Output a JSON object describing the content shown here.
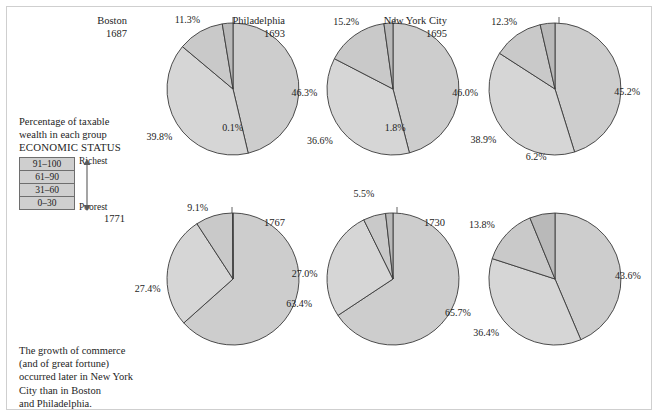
{
  "figure": {
    "caption_top": "Percentage of taxable\nwealth in each group",
    "economic_status_label": "ECONOMIC STATUS",
    "caption_bottom": "The growth of commerce\n(and of great fortune)\noccurred later in New York\nCity than in Boston\nand Philadelphia."
  },
  "legend": {
    "richest_label": "Richest",
    "poorest_label": "Poorest",
    "bands": [
      {
        "label": "91–100",
        "color": "#cfcfcf"
      },
      {
        "label": "61–90",
        "color": "#cfcfcf"
      },
      {
        "label": "31–60",
        "color": "#cfcfcf"
      },
      {
        "label": "0–30",
        "color": "#cfcfcf"
      }
    ]
  },
  "chart_data": {
    "type": "pie",
    "title": "Percentage of taxable wealth in each group",
    "categories": [
      "91–100",
      "61–90",
      "31–60",
      "0–30"
    ],
    "legend_position": "left",
    "charts": [
      {
        "city": "Boston",
        "year": "1687",
        "values": [
          46.3,
          39.8,
          11.3,
          2.6
        ],
        "labels": [
          "46.3%",
          "39.8%",
          "11.3%",
          "2.6%"
        ]
      },
      {
        "city": "Philadelphia",
        "year": "1693",
        "values": [
          46.0,
          36.6,
          15.2,
          2.2
        ],
        "labels": [
          "46.0%",
          "36.6%",
          "15.2%",
          "2.2%"
        ]
      },
      {
        "city": "New York City",
        "year": "1695",
        "values": [
          45.2,
          38.9,
          12.3,
          3.6
        ],
        "labels": [
          "45.2%",
          "38.9%",
          "12.3%",
          "3.6%"
        ]
      },
      {
        "city": "",
        "year": "1771",
        "values": [
          63.4,
          27.4,
          9.1,
          0.1
        ],
        "labels": [
          "63.4%",
          "27.4%",
          "9.1%",
          "0.1%"
        ]
      },
      {
        "city": "",
        "year": "1767",
        "values": [
          65.7,
          27.0,
          5.5,
          1.8
        ],
        "labels": [
          "65.7%",
          "27.0%",
          "5.5%",
          "1.8%"
        ]
      },
      {
        "city": "",
        "year": "1730",
        "values": [
          43.6,
          36.4,
          13.8,
          6.2
        ],
        "labels": [
          "43.6%",
          "36.4%",
          "13.8%",
          "6.2%"
        ]
      }
    ],
    "slice_colors": [
      "#cdcdcd",
      "#d6d6d6",
      "#c9c9c9",
      "#b9b9b9"
    ],
    "outline_color": "#3a3a3a"
  }
}
